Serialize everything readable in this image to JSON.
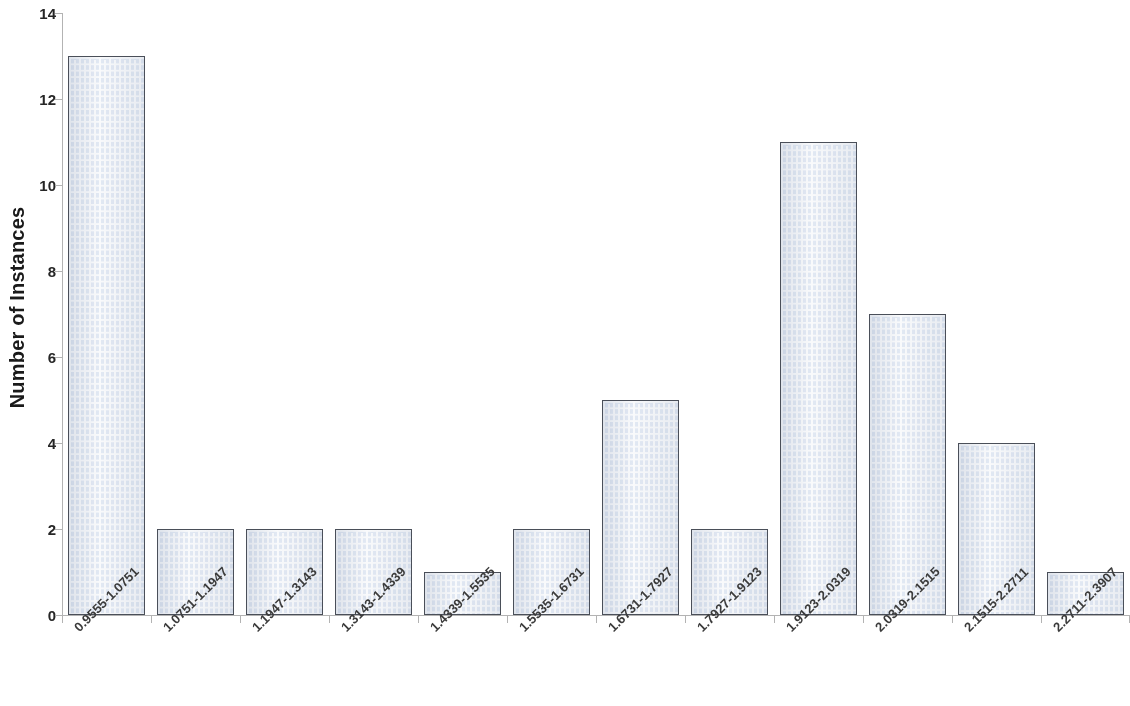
{
  "chart_data": {
    "type": "bar",
    "title": "",
    "subtitle": "",
    "xlabel": "",
    "ylabel": "Number of Instances",
    "ylim": [
      0,
      14
    ],
    "y_ticks": [
      0,
      2,
      4,
      6,
      8,
      10,
      12,
      14
    ],
    "grid": false,
    "legend": null,
    "bar_style": {
      "fill_pattern": "brick-masonry",
      "fill_color": "#e8eef7",
      "mortar_color": "#ffffff",
      "border_color": "#4a4f59"
    },
    "categories": [
      "0.9555-1.0751",
      "1.0751-1.1947",
      "1.1947-1.3143",
      "1.3143-1.4339",
      "1.4339-1.5535",
      "1.5535-1.6731",
      "1.6731-1.7927",
      "1.7927-1.9123",
      "1.9123-2.0319",
      "2.0319-2.1515",
      "2.1515-2.2711",
      "2.2711-2.3907"
    ],
    "values": [
      13,
      2,
      2,
      2,
      1,
      2,
      5,
      2,
      11,
      7,
      4,
      1
    ]
  },
  "axis": {
    "y_title": "Number of Instances",
    "y_tick_labels": [
      "0",
      "2",
      "4",
      "6",
      "8",
      "10",
      "12",
      "14"
    ]
  }
}
